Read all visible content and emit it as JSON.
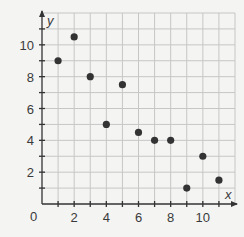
{
  "chart_data": {
    "type": "scatter",
    "title": "",
    "xlabel": "x",
    "ylabel": "y",
    "xlim": [
      0,
      12
    ],
    "ylim": [
      0,
      12
    ],
    "grid": true,
    "legend": null,
    "origin_label": "0",
    "x_ticks": [
      2,
      4,
      6,
      8,
      10
    ],
    "y_ticks": [
      2,
      4,
      6,
      8,
      10
    ],
    "points": [
      {
        "x": 1,
        "y": 9
      },
      {
        "x": 2,
        "y": 10.5
      },
      {
        "x": 3,
        "y": 8
      },
      {
        "x": 4,
        "y": 5
      },
      {
        "x": 5,
        "y": 7.5
      },
      {
        "x": 6,
        "y": 4.5
      },
      {
        "x": 7,
        "y": 4
      },
      {
        "x": 8,
        "y": 4
      },
      {
        "x": 9,
        "y": 1
      },
      {
        "x": 10,
        "y": 3
      },
      {
        "x": 11,
        "y": 1.5
      }
    ],
    "colors": {
      "background": "#f4f4f3",
      "grid": "#c6c6c6",
      "axis": "#333333",
      "point": "#333333"
    }
  }
}
